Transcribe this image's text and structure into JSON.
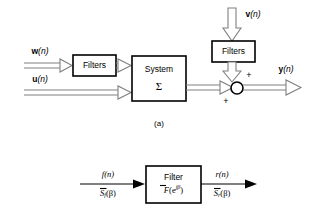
{
  "figure": {
    "background_color": "#ffffff",
    "line_color": "#808080",
    "stroke_color": "#000000",
    "panel_a": {
      "caption": "(a)",
      "boxes": [
        {
          "id": "filters-left",
          "label": "Filters"
        },
        {
          "id": "system",
          "label": "System",
          "sublabel": "Σ"
        },
        {
          "id": "filters-top",
          "label": "Filters"
        }
      ],
      "signals": {
        "w_bold": "w",
        "w_paren": "(n)",
        "u_bold": "u",
        "u_paren": "(n)",
        "v_bold": "v",
        "v_paren": "(n)",
        "y_bold": "y",
        "y_paren": "(n)"
      },
      "summing_node": {
        "sign_top": "+",
        "sign_bottom": "+"
      }
    },
    "panel_b": {
      "box": {
        "label": "Filter",
        "transfer_base": "F",
        "transfer_arg_open": "(e",
        "transfer_exp": "jβ",
        "transfer_arg_close": ")"
      },
      "input": {
        "top_base": "f",
        "top_paren": "(n)",
        "bottom_base": "S",
        "bottom_sub": "f",
        "bottom_paren": "(β)"
      },
      "output": {
        "top_base": "r",
        "top_paren": "(n)",
        "bottom_base": "S",
        "bottom_sub": "r",
        "bottom_paren": "(β)"
      }
    }
  }
}
